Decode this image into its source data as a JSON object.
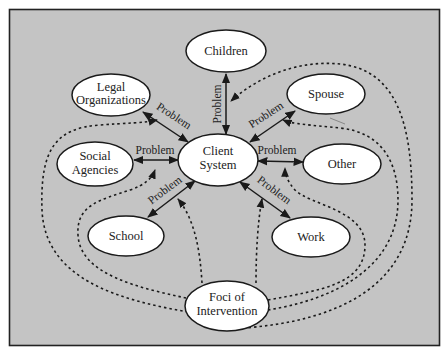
{
  "diagram": {
    "background_color": "#c4c4c4",
    "frame_color": "#222222",
    "node_fill": "#ffffff",
    "center_node": {
      "id": "client",
      "label_lines": [
        "Client",
        "System"
      ],
      "line1": "Client",
      "line2": "System"
    },
    "nodes": {
      "children": {
        "line1": "Children"
      },
      "legal": {
        "line1": "Legal",
        "line2": "Organizations"
      },
      "spouse": {
        "line1": "Spouse"
      },
      "social": {
        "line1": "Social",
        "line2": "Agencies"
      },
      "other": {
        "line1": "Other"
      },
      "school": {
        "line1": "School"
      },
      "work": {
        "line1": "Work"
      },
      "foci": {
        "line1": "Foci of",
        "line2": "Intervention"
      }
    },
    "edges": [
      {
        "from": "client",
        "to": "children",
        "label": "Problem",
        "style": "solid-double-arrow"
      },
      {
        "from": "client",
        "to": "legal",
        "label": "Problem",
        "style": "solid-double-arrow"
      },
      {
        "from": "client",
        "to": "spouse",
        "label": "Problem",
        "style": "solid-double-arrow"
      },
      {
        "from": "client",
        "to": "social",
        "label": "Problem",
        "style": "solid-double-arrow"
      },
      {
        "from": "client",
        "to": "other",
        "label": "Problem",
        "style": "solid-double-arrow"
      },
      {
        "from": "client",
        "to": "school",
        "label": "Problem",
        "style": "solid-double-arrow"
      },
      {
        "from": "client",
        "to": "work",
        "label": "Problem",
        "style": "solid-double-arrow"
      }
    ],
    "edge_labels": {
      "children": "Problem",
      "legal": "Problem",
      "spouse": "Problem",
      "social": "Problem",
      "other": "Problem",
      "school": "Problem",
      "work": "Problem"
    },
    "intervention_links": [
      {
        "from": "foci",
        "to": "edge:children",
        "style": "dotted-arrow"
      },
      {
        "from": "foci",
        "to": "edge:legal",
        "style": "dotted-arrow"
      },
      {
        "from": "foci",
        "to": "edge:spouse",
        "style": "dotted-arrow"
      },
      {
        "from": "foci",
        "to": "edge:social",
        "style": "dotted-arrow"
      },
      {
        "from": "foci",
        "to": "edge:other",
        "style": "dotted-arrow"
      },
      {
        "from": "foci",
        "to": "edge:school",
        "style": "dotted-arrow"
      },
      {
        "from": "foci",
        "to": "edge:work",
        "style": "dotted-arrow"
      }
    ]
  }
}
